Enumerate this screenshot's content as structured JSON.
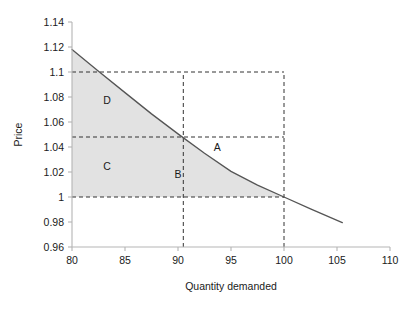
{
  "chart_data": {
    "type": "line",
    "title": "",
    "xlabel": "Quantity demanded",
    "ylabel": "Price",
    "xlim": [
      80,
      110
    ],
    "ylim": [
      0.96,
      1.14
    ],
    "xticks": [
      "80",
      "85",
      "90",
      "95",
      "100",
      "105",
      "110"
    ],
    "xtick_values": [
      80,
      85,
      90,
      95,
      100,
      105,
      110
    ],
    "yticks": [
      "0.96",
      "0.98",
      "1",
      "1.02",
      "1.04",
      "1.06",
      "1.08",
      "1.1",
      "1.12",
      "1.14"
    ],
    "ytick_values": [
      0.96,
      0.98,
      1.0,
      1.02,
      1.04,
      1.06,
      1.08,
      1.1,
      1.12,
      1.14
    ],
    "grid": false,
    "legend": "none",
    "series": [
      {
        "name": "Demand curve",
        "color": "#555555",
        "x": [
          80,
          82.5,
          85,
          87.5,
          90,
          92.5,
          95,
          97.5,
          100,
          102.5,
          105.5
        ],
        "y": [
          1.118,
          1.1005,
          1.0835,
          1.0665,
          1.0505,
          1.035,
          1.0205,
          1.0095,
          1.0,
          0.9905,
          0.9795
        ]
      }
    ],
    "reference_lines": [
      {
        "name": "price-1.1-line",
        "orientation": "horizontal",
        "value": 1.1,
        "x_from": 80,
        "x_to": 100,
        "style": "dashed"
      },
      {
        "name": "price-1.048-line",
        "orientation": "horizontal",
        "value": 1.048,
        "x_from": 80,
        "x_to": 100,
        "style": "dashed"
      },
      {
        "name": "price-1.0-line",
        "orientation": "horizontal",
        "value": 1.0,
        "x_from": 80,
        "x_to": 100,
        "style": "dashed"
      },
      {
        "name": "quantity-90.5-line",
        "orientation": "vertical",
        "value": 90.5,
        "y_from": 0.96,
        "y_to": 1.1,
        "style": "dashed"
      },
      {
        "name": "quantity-100-line",
        "orientation": "vertical",
        "value": 100,
        "y_from": 0.96,
        "y_to": 1.1,
        "style": "dashed"
      }
    ],
    "shaded_region": {
      "name": "consumer-surplus-shaded-area",
      "fill": "#e2e2e2",
      "description": "Area under the demand curve above price 1.00 from quantity 80 to 100"
    },
    "annotations": [
      {
        "label": "D",
        "x": 83.3,
        "y": 1.0745
      },
      {
        "label": "A",
        "x": 93.7,
        "y": 1.0365
      },
      {
        "label": "C",
        "x": 83.3,
        "y": 1.0215
      },
      {
        "label": "B",
        "x": 90.0,
        "y": 1.0155
      }
    ]
  },
  "axes": {
    "price_axis_label": "Price",
    "quantity_axis_label": "Quantity demanded"
  },
  "colors": {
    "shade": "#e2e2e2",
    "curve": "#555555",
    "axis": "#b5b5b5",
    "dash": "#333333",
    "text": "#1a1a1a"
  }
}
